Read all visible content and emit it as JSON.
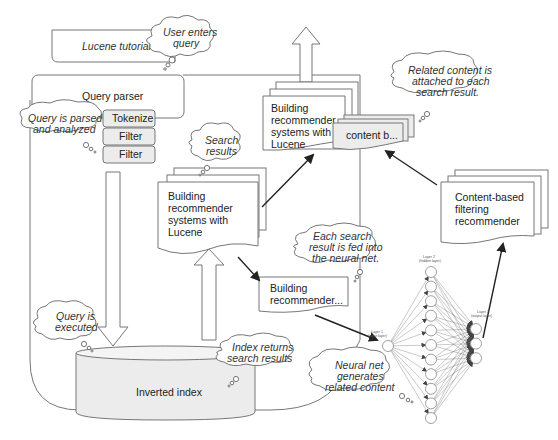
{
  "title_box": {
    "label": "Lucene tutorial"
  },
  "query_parser": {
    "label": "Query parser",
    "steps": [
      "Tokenize",
      "Filter",
      "Filter"
    ]
  },
  "clouds": {
    "user_enters": [
      "User enters",
      "query"
    ],
    "parsed": [
      "Query is parsed",
      "and analyzed"
    ],
    "search_results": [
      "Search",
      "results"
    ],
    "executed": [
      "Query is",
      "executed"
    ],
    "index_returns": [
      "Index returns",
      "search results"
    ],
    "fed_into": [
      "Each search",
      "result is fed into",
      "the neural net."
    ],
    "generates": [
      "Neural net",
      "generates",
      "related content"
    ],
    "attached": [
      "Related content is",
      "attached to each",
      "search result."
    ]
  },
  "documents": {
    "search_result_stack": [
      "Building",
      "recommender",
      "systems with",
      "Lucene"
    ],
    "top_result_stack": [
      "Building",
      "recommender",
      "systems with",
      "Lucene"
    ],
    "single_result": [
      "Building",
      "recommender..."
    ],
    "content_tag": "content b...",
    "cbf_recommender": [
      "Content-based",
      "filtering",
      "recommender"
    ]
  },
  "index": {
    "label": "Inverted index"
  },
  "neural_net": {
    "layer1": [
      "Layer 1",
      "(input layer)"
    ],
    "layer2": [
      "Layer 2",
      "(hidden layer)"
    ],
    "layer3": [
      "Layer 3",
      "(output layer)"
    ],
    "hidden_nodes": 11,
    "output_nodes": 3
  }
}
